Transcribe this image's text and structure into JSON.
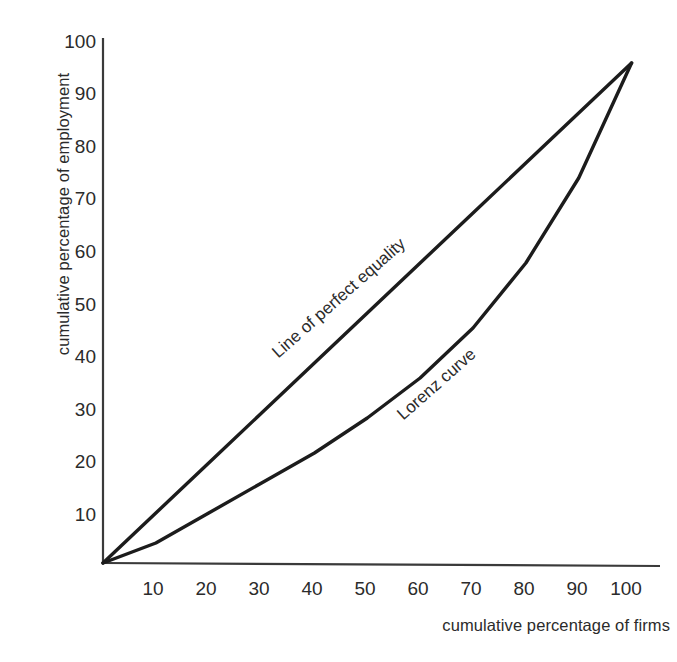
{
  "chart_data": {
    "type": "line",
    "title": "",
    "subtitle": "",
    "xlabel": "cumulative percentage of firms",
    "ylabel": "cumulative percentage of employment",
    "xlim": [
      0,
      105
    ],
    "ylim": [
      0,
      105
    ],
    "xticks": [
      "10",
      "20",
      "30",
      "40",
      "50",
      "60",
      "70",
      "80",
      "90",
      "100"
    ],
    "yticks": [
      "10",
      "20",
      "30",
      "40",
      "50",
      "60",
      "70",
      "80",
      "90",
      "100"
    ],
    "xtick_values": [
      10,
      20,
      30,
      40,
      50,
      60,
      70,
      80,
      90,
      100
    ],
    "ytick_values": [
      10,
      20,
      30,
      40,
      50,
      60,
      70,
      80,
      90,
      100
    ],
    "grid": false,
    "legend": "inline-annotations",
    "x": [
      0,
      10,
      20,
      30,
      40,
      50,
      60,
      70,
      80,
      90,
      100
    ],
    "series": [
      {
        "name": "Line of perfect equality",
        "color": "#1c1c1c",
        "annotation": "Line of perfect equality",
        "values": [
          0,
          10,
          20,
          30,
          40,
          50,
          60,
          70,
          80,
          90,
          100
        ]
      },
      {
        "name": "Lorenz curve",
        "color": "#1c1c1c",
        "annotation": "Lorenz curve",
        "values": [
          0,
          4,
          10,
          16,
          22,
          29,
          37,
          47,
          60,
          77,
          100
        ]
      }
    ],
    "axis_color": "#3a3a3a",
    "line_color": "#1c1c1c",
    "background": "#ffffff"
  },
  "annotations": {
    "line_of_perfect_equality": "Line of perfect equality",
    "lorenz_curve": "Lorenz curve"
  }
}
